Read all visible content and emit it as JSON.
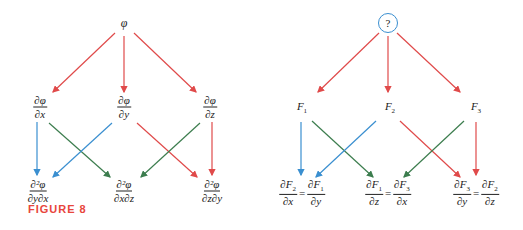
{
  "colors": {
    "red": "#e04a4a",
    "blue": "#3a8fd0",
    "green": "#3c7d4e",
    "caption": "#e8463c"
  },
  "left": {
    "top": "φ",
    "middle": [
      {
        "num": "∂φ",
        "den": "∂x"
      },
      {
        "num": "∂φ",
        "den": "∂y"
      },
      {
        "num": "∂φ",
        "den": "∂z"
      }
    ],
    "bottom": [
      {
        "num": "∂²φ",
        "den": "∂y∂x"
      },
      {
        "num": "∂²φ",
        "den": "∂x∂z"
      },
      {
        "num": "∂²φ",
        "den": "∂z∂y"
      }
    ]
  },
  "right": {
    "top": "?",
    "middle": [
      "F1",
      "F2",
      "F3"
    ],
    "bottom": [
      {
        "l_num": "∂F2",
        "l_den": "∂x",
        "r_num": "∂F1",
        "r_den": "∂y"
      },
      {
        "l_num": "∂F1",
        "l_den": "∂z",
        "r_num": "∂F3",
        "r_den": "∂x"
      },
      {
        "l_num": "∂F3",
        "l_den": "∂y",
        "r_num": "∂F2",
        "r_den": "∂z"
      }
    ],
    "equals": "="
  },
  "caption": "FIGURE 8"
}
